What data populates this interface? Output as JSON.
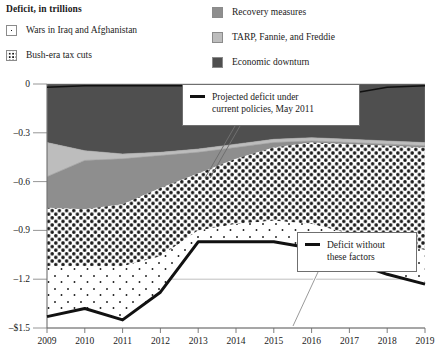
{
  "legend": {
    "title": "Deficit, in trillions",
    "left_items": [
      {
        "label": "Wars in Iraq and Afghanistan",
        "swatch": "sparse-dots-swatch",
        "color": "#ffffff"
      },
      {
        "label": "Bush-era tax cuts",
        "swatch": "dense-dots-swatch",
        "color": "#ffffff"
      }
    ],
    "right_items": [
      {
        "label": "Recovery measures",
        "swatch": "solid-gray-swatch",
        "color": "#8e8e8e"
      },
      {
        "label": "TARP, Fannie, and Freddie",
        "swatch": "solid-light-gray-swatch",
        "color": "#bdbdbd"
      },
      {
        "label": "Economic downturn",
        "swatch": "solid-dark-gray-swatch",
        "color": "#4f4f4f"
      }
    ]
  },
  "annotations": [
    {
      "id": "projected",
      "line1": "Projected deficit under",
      "line2": "current policies, May 2011"
    },
    {
      "id": "without",
      "line1": "Deficit without",
      "line2": "these factors"
    }
  ],
  "chart_data": {
    "type": "area",
    "title": "Deficit, in trillions",
    "xlabel": "",
    "ylabel": "Deficit, in trillions",
    "grid": true,
    "legend_position": "top",
    "x": [
      "2009",
      "2010",
      "2011",
      "2012",
      "2013",
      "2014",
      "2015",
      "2016",
      "2017",
      "2018",
      "2019"
    ],
    "categories": [
      "2009",
      "2010",
      "2011",
      "2012",
      "2013",
      "2014",
      "2015",
      "2016",
      "2017",
      "2018",
      "2019"
    ],
    "ylim": [
      -1.5,
      0
    ],
    "yticks": [
      -1.5,
      -1.2,
      -0.9,
      -0.6,
      -0.3,
      0
    ],
    "ytick_labels": [
      "–$1.5",
      "–1.2",
      "–0.9",
      "–0.6",
      "–0.3",
      "0"
    ],
    "stack_order_bottom_to_top": [
      "Economic downturn",
      "TARP, Fannie, and Freddie",
      "Recovery measures",
      "Bush-era tax cuts",
      "Wars in Iraq and Afghanistan"
    ],
    "series": [
      {
        "name": "Economic downturn",
        "fill": "#4f4f4f",
        "values": [
          -0.36,
          -0.41,
          -0.43,
          -0.42,
          -0.4,
          -0.37,
          -0.34,
          -0.33,
          -0.34,
          -0.35,
          -0.36
        ]
      },
      {
        "name": "TARP, Fannie, and Freddie",
        "fill": "#bdbdbd",
        "values": [
          -0.21,
          -0.06,
          -0.03,
          -0.02,
          -0.02,
          -0.02,
          -0.02,
          -0.02,
          -0.02,
          -0.02,
          -0.02
        ]
      },
      {
        "name": "Recovery measures",
        "fill": "#8e8e8e",
        "values": [
          -0.19,
          -0.3,
          -0.28,
          -0.2,
          -0.13,
          -0.07,
          -0.03,
          -0.01,
          -0.01,
          -0.01,
          -0.01
        ]
      },
      {
        "name": "Bush-era tax cuts",
        "fill": "#ffffff",
        "pattern": "dense-dots",
        "values": [
          -0.36,
          -0.35,
          -0.38,
          -0.42,
          -0.35,
          -0.4,
          -0.45,
          -0.5,
          -0.55,
          -0.6,
          -0.63
        ]
      },
      {
        "name": "Wars in Iraq and Afghanistan",
        "fill": "#ffffff",
        "pattern": "sparse-dots",
        "values": [
          -0.31,
          -0.26,
          -0.33,
          -0.22,
          -0.07,
          -0.11,
          -0.13,
          -0.15,
          -0.17,
          -0.19,
          -0.21
        ]
      }
    ],
    "lines": [
      {
        "name": "Projected deficit under current policies, May 2011",
        "color": "#111111",
        "width": 3,
        "values": [
          -1.43,
          -1.38,
          -1.45,
          -1.28,
          -0.97,
          -0.97,
          -0.97,
          -1.01,
          -1.09,
          -1.17,
          -1.23
        ]
      },
      {
        "name": "Deficit without these factors",
        "color": "#111111",
        "width": 1.5,
        "values": [
          -0.02,
          -0.01,
          -0.01,
          -0.01,
          -0.01,
          -0.01,
          -0.02,
          -0.02,
          -0.06,
          -0.02,
          -0.01
        ]
      }
    ]
  }
}
